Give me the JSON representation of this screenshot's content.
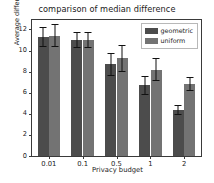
{
  "chart_data": {
    "type": "bar",
    "title": "comparison of median difference",
    "xlabel": "Privacy budget",
    "ylabel": "Average difference",
    "categories": [
      "0.01",
      "0.1",
      "0.5",
      "1",
      "2"
    ],
    "ylim": [
      0,
      12.9
    ],
    "yticks": [
      0,
      2,
      4,
      6,
      8,
      10,
      12
    ],
    "ytick_labels": [
      "0",
      "2",
      "4",
      "6",
      "8",
      "10",
      "12"
    ],
    "grid": false,
    "legend_position": "upper right",
    "series": [
      {
        "name": "geometric",
        "color": "#4c4c4c",
        "values": [
          11.3,
          11.0,
          8.7,
          6.7,
          4.35
        ],
        "errors": [
          0.95,
          0.75,
          1.1,
          0.9,
          0.45
        ]
      },
      {
        "name": "uniform",
        "color": "#737373",
        "values": [
          11.4,
          11.0,
          9.25,
          8.2,
          6.8
        ],
        "errors": [
          1.1,
          0.75,
          1.3,
          1.1,
          0.65
        ]
      }
    ]
  },
  "legend": {
    "entries": [
      {
        "label": "geometric"
      },
      {
        "label": "uniform"
      }
    ]
  }
}
